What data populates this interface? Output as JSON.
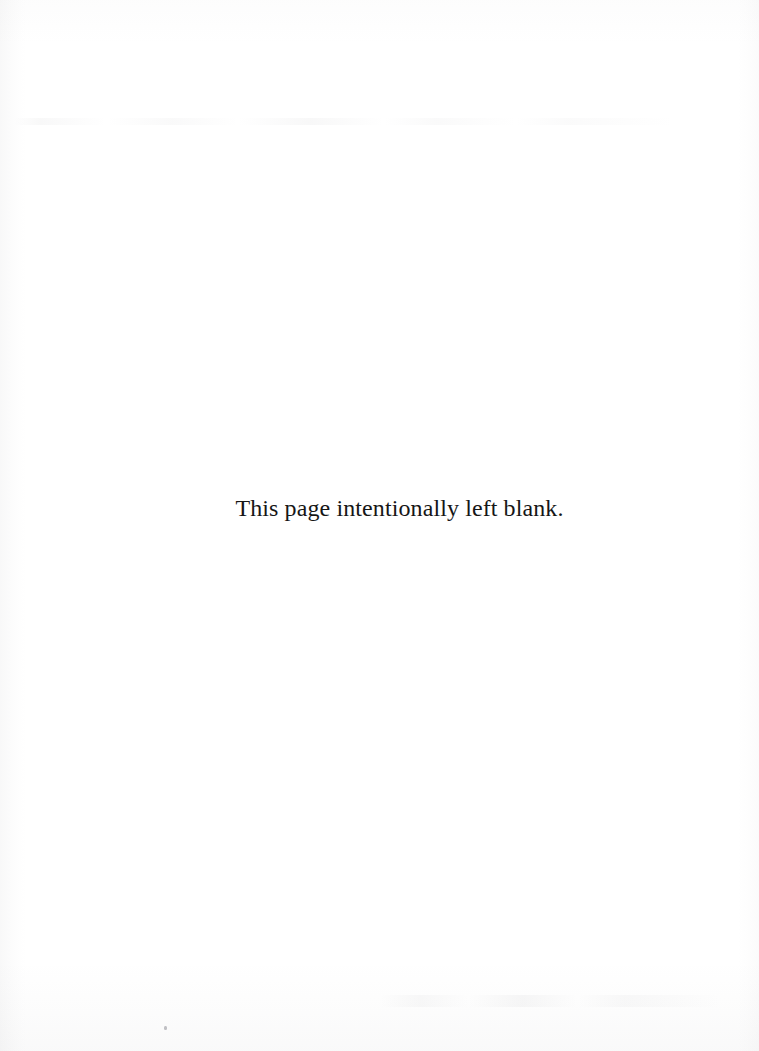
{
  "page": {
    "kind": "scanned-document-page",
    "background_color": "#ffffff",
    "text_color": "#161616",
    "width_px": 759,
    "height_px": 1051
  },
  "body": {
    "notice_text": "This page intentionally left blank."
  },
  "artifacts": {
    "left_edge_shadow": "scan-edge-shadow",
    "right_edge_shadow": "scan-edge-shadow",
    "top_tone": "scan-paper-tone",
    "bottom_tone": "scan-paper-tone",
    "ghost_band_top": "bleed-through-ghost-text",
    "ghost_band_bottom": "bleed-through-ghost-text",
    "speck": "dust-speck"
  }
}
